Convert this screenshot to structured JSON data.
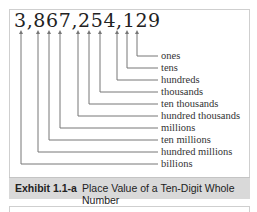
{
  "figure": {
    "number": "3,867,254,129",
    "places": [
      {
        "label": "ones",
        "digit": "9"
      },
      {
        "label": "tens",
        "digit": "2"
      },
      {
        "label": "hundreds",
        "digit": "1"
      },
      {
        "label": "thousands",
        "digit": "4"
      },
      {
        "label": "ten thousands",
        "digit": "5"
      },
      {
        "label": "hundred thousands",
        "digit": "2"
      },
      {
        "label": "millions",
        "digit": "7"
      },
      {
        "label": "ten millions",
        "digit": "6"
      },
      {
        "label": "hundred millions",
        "digit": "8"
      },
      {
        "label": "billions",
        "digit": "3"
      }
    ]
  },
  "caption": {
    "id": "Exhibit 1.1-a",
    "title": "Place Value of a Ten-Digit Whole Number"
  }
}
